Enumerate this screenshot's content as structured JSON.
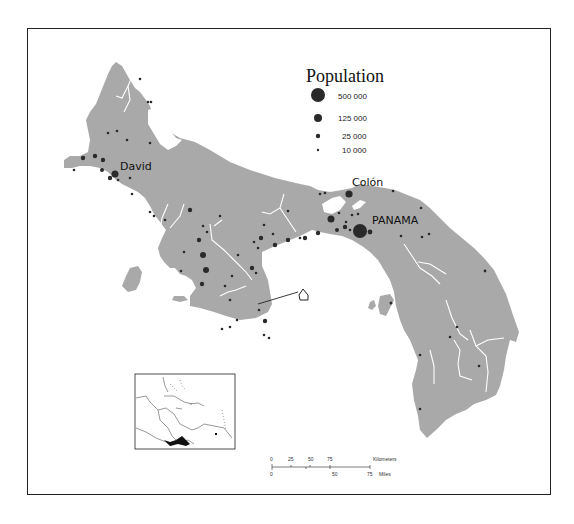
{
  "map": {
    "colors": {
      "land": "#a9a9a9",
      "water": "#ffffff",
      "rivers": "#ffffff",
      "dots": "#2a2a2a",
      "frame": "#222222"
    },
    "legend": {
      "title": "Population",
      "items": [
        {
          "label": "500 000",
          "radius": 7
        },
        {
          "label": "125 000",
          "radius": 4
        },
        {
          "label": "25 000",
          "radius": 2.2
        },
        {
          "label": "10 000",
          "radius": 1.2
        }
      ]
    },
    "cities": [
      {
        "name": "David"
      },
      {
        "name": "Colón"
      },
      {
        "name": "PANAMA"
      }
    ],
    "scale_bar": {
      "km_ticks": [
        "0",
        "25",
        "50",
        "75"
      ],
      "km_label": "Kilometers",
      "mi_ticks": [
        "0",
        "50",
        "75"
      ],
      "mi_label": "Miles"
    },
    "inset": {
      "description": "Caribbean locator map with Panama highlighted"
    }
  }
}
